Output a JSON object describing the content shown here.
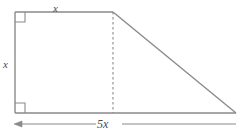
{
  "figure": {
    "kind": "geometry-diagram",
    "stroke_color": "#8a8a8a",
    "label_color": "#4a4a4a",
    "background_color": "#ffffff",
    "labels": {
      "top_side": "x",
      "left_side": "x",
      "base_dimension": "5x"
    },
    "markers": {
      "top_left_right_angle": "right-angle-marker",
      "bottom_left_right_angle": "right-angle-marker"
    },
    "geometry": {
      "square_left_x": 15,
      "square_top_y": 12,
      "square_bottom_y": 113,
      "square_right_x": 113,
      "triangle_apex_x": 113,
      "triangle_apex_y": 12,
      "triangle_far_x": 233,
      "dimension_line_y": 124,
      "dimension_arrow_x": 15
    }
  }
}
